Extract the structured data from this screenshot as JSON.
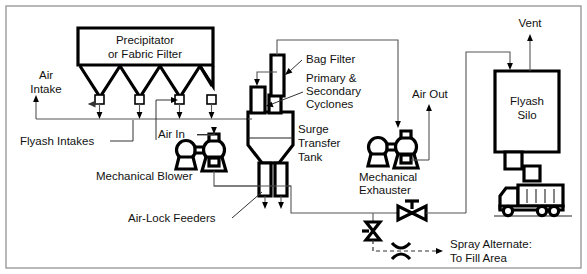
{
  "diagram": {
    "frame_color": "#9a9a9a",
    "line_color": "#000000",
    "pipe_color": "#555555",
    "background": "#ffffff",
    "labels": {
      "precipitator_line1": "Precipitator",
      "precipitator_line2": "or Fabric Filter",
      "air_intake_line1": "Air",
      "air_intake_line2": "Intake",
      "flyash_intakes": "Flyash Intakes",
      "air_in": "Air In",
      "mechanical_blower": "Mechanical Blower",
      "air_lock_feeders": "Air-Lock Feeders",
      "bag_filter": "Bag Filter",
      "cyclones_line1": "Primary &",
      "cyclones_line2": "Secondary",
      "cyclones_line3": "Cyclones",
      "surge_tank_line1": "Surge",
      "surge_tank_line2": "Transfer",
      "surge_tank_line3": "Tank",
      "air_out": "Air Out",
      "mechanical_exhauster_line1": "Mechanical",
      "mechanical_exhauster_line2": "Exhauster",
      "vent": "Vent",
      "flyash_silo_line1": "Flyash",
      "flyash_silo_line2": "Silo",
      "spray_alternate_line1": "Spray Alternate:",
      "spray_alternate_line2": "To Fill Area"
    },
    "components": [
      {
        "id": "precipitator",
        "name": "Precipitator or Fabric Filter",
        "hopper_count": 4
      },
      {
        "id": "flyash-intake-valves",
        "name": "Flyash Intake Valves",
        "count": 4
      },
      {
        "id": "mechanical-blower",
        "name": "Mechanical Blower"
      },
      {
        "id": "surge-transfer-tank",
        "name": "Surge Transfer Tank"
      },
      {
        "id": "bag-filter",
        "name": "Bag Filter"
      },
      {
        "id": "cyclones",
        "name": "Primary & Secondary Cyclones"
      },
      {
        "id": "air-lock-feeders",
        "name": "Air-Lock Feeders",
        "count": 2
      },
      {
        "id": "mechanical-exhauster",
        "name": "Mechanical Exhauster"
      },
      {
        "id": "flyash-silo",
        "name": "Flyash Silo"
      },
      {
        "id": "dump-truck",
        "name": "Dump Truck",
        "wheels": 3,
        "body_ribs": 4
      },
      {
        "id": "gate-valve-horizontal",
        "name": "Horizontal Gate Valve"
      },
      {
        "id": "gate-valve-vertical",
        "name": "Vertical Gate Valve"
      },
      {
        "id": "flex-connector",
        "name": "Flexible Connector"
      }
    ]
  }
}
